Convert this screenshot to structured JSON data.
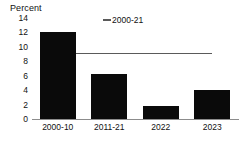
{
  "chart_data": {
    "type": "bar",
    "title": "",
    "subtitle": "",
    "xlabel": "",
    "ylabel": "Percent",
    "categories": [
      "2000-10",
      "2011-21",
      "2022",
      "2023"
    ],
    "values": [
      12.1,
      6.3,
      1.8,
      4.0
    ],
    "series": [
      {
        "name": "bars",
        "type": "bar",
        "values": [
          12.1,
          6.3,
          1.8,
          4.0
        ],
        "color": "#0a0a0a"
      },
      {
        "name": "2000-21",
        "type": "line",
        "value": 9.0,
        "color": "#5a5a5a"
      }
    ],
    "ylim": [
      0,
      14
    ],
    "yticks": [
      0,
      2,
      4,
      6,
      8,
      10,
      12,
      14
    ],
    "ytick_labels": [
      "0",
      "2",
      "4",
      "6",
      "8",
      "10",
      "12",
      "14"
    ],
    "grid": false,
    "legend": {
      "position": "top-center",
      "entries": [
        {
          "label": "2000-21",
          "marker": "line",
          "color": "#5a5a5a"
        }
      ]
    },
    "annotations": []
  },
  "axis": {
    "y_title": "Percent",
    "y_ticks": [
      "14",
      "12",
      "10",
      "8",
      "6",
      "4",
      "2",
      "0"
    ],
    "x_ticks": [
      "2000-10",
      "2011-21",
      "2022",
      "2023"
    ]
  },
  "legend": {
    "entry_label": "2000-21",
    "marker_name": "line-marker"
  },
  "colors": {
    "bar": "#0a0a0a",
    "reference_line": "#5a5a5a",
    "axis": "#8c8c8c",
    "text": "#111111",
    "background": "#ffffff"
  }
}
